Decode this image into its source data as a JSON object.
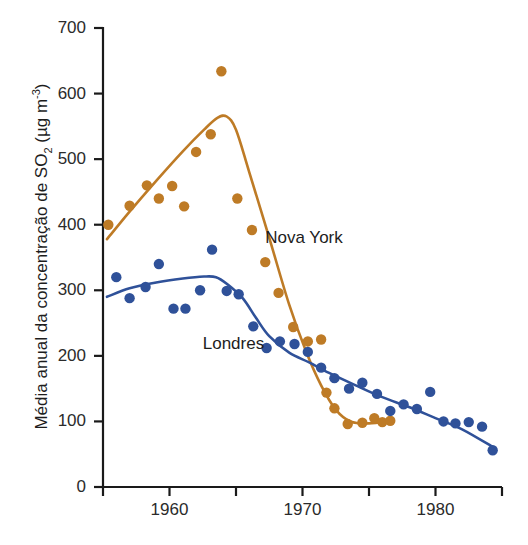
{
  "chart_data": {
    "type": "scatter",
    "title": "",
    "xlabel": "",
    "ylabel": "Média anual da concentração de SO2 (µg m-3)",
    "ylabel_parts": {
      "prefix": "Média anual da concentração de SO",
      "sub": "2",
      "mid": " (µg m",
      "sup": "-3",
      "suffix": ")"
    },
    "xlim": [
      1955,
      1985
    ],
    "ylim": [
      0,
      700
    ],
    "grid": false,
    "legend_position": "inline-annotations",
    "y_ticks": [
      0,
      100,
      200,
      300,
      400,
      500,
      600,
      700
    ],
    "y_tick_labels": [
      "0",
      "100",
      "200",
      "300",
      "400",
      "500",
      "600",
      "700"
    ],
    "x_ticks": [
      1955,
      1960,
      1965,
      1970,
      1975,
      1980,
      1985
    ],
    "x_tick_labels": [
      "",
      "1960",
      "",
      "1970",
      "",
      "1980",
      ""
    ],
    "series": [
      {
        "name": "Nova York",
        "color": "#BE7B26",
        "annotation": "Nova York",
        "annotation_x": 1967.2,
        "annotation_y": 380,
        "points": [
          {
            "x": 1955.4,
            "y": 400
          },
          {
            "x": 1957.0,
            "y": 429
          },
          {
            "x": 1958.3,
            "y": 460
          },
          {
            "x": 1959.2,
            "y": 440
          },
          {
            "x": 1960.2,
            "y": 459
          },
          {
            "x": 1961.1,
            "y": 428
          },
          {
            "x": 1962.0,
            "y": 511
          },
          {
            "x": 1963.1,
            "y": 538
          },
          {
            "x": 1963.9,
            "y": 634
          },
          {
            "x": 1965.1,
            "y": 440
          },
          {
            "x": 1966.2,
            "y": 392
          },
          {
            "x": 1967.2,
            "y": 343
          },
          {
            "x": 1968.2,
            "y": 296
          },
          {
            "x": 1969.3,
            "y": 244
          },
          {
            "x": 1970.4,
            "y": 222
          },
          {
            "x": 1971.4,
            "y": 225
          },
          {
            "x": 1971.8,
            "y": 144
          },
          {
            "x": 1972.4,
            "y": 120
          },
          {
            "x": 1973.4,
            "y": 96
          },
          {
            "x": 1974.5,
            "y": 98
          },
          {
            "x": 1975.4,
            "y": 105
          },
          {
            "x": 1976.0,
            "y": 99
          },
          {
            "x": 1976.6,
            "y": 101
          }
        ],
        "trend": [
          {
            "x": 1955.3,
            "y": 378
          },
          {
            "x": 1957.0,
            "y": 420
          },
          {
            "x": 1959.0,
            "y": 467
          },
          {
            "x": 1961.0,
            "y": 512
          },
          {
            "x": 1962.6,
            "y": 545
          },
          {
            "x": 1963.6,
            "y": 563
          },
          {
            "x": 1964.3,
            "y": 565
          },
          {
            "x": 1965.0,
            "y": 545
          },
          {
            "x": 1966.0,
            "y": 480
          },
          {
            "x": 1967.5,
            "y": 380
          },
          {
            "x": 1969.0,
            "y": 278
          },
          {
            "x": 1970.3,
            "y": 205
          },
          {
            "x": 1971.4,
            "y": 155
          },
          {
            "x": 1972.5,
            "y": 118
          },
          {
            "x": 1973.6,
            "y": 100
          },
          {
            "x": 1975.0,
            "y": 97
          },
          {
            "x": 1976.6,
            "y": 101
          }
        ]
      },
      {
        "name": "Londres",
        "color": "#2F5199",
        "annotation": "Londres",
        "annotation_x": 1962.5,
        "annotation_y": 218,
        "points": [
          {
            "x": 1956.0,
            "y": 320
          },
          {
            "x": 1957.0,
            "y": 288
          },
          {
            "x": 1958.2,
            "y": 305
          },
          {
            "x": 1959.2,
            "y": 340
          },
          {
            "x": 1960.3,
            "y": 272
          },
          {
            "x": 1961.2,
            "y": 272
          },
          {
            "x": 1962.3,
            "y": 300
          },
          {
            "x": 1963.2,
            "y": 362
          },
          {
            "x": 1964.3,
            "y": 299
          },
          {
            "x": 1965.2,
            "y": 294
          },
          {
            "x": 1966.3,
            "y": 245
          },
          {
            "x": 1967.3,
            "y": 212
          },
          {
            "x": 1968.3,
            "y": 222
          },
          {
            "x": 1969.4,
            "y": 218
          },
          {
            "x": 1970.4,
            "y": 206
          },
          {
            "x": 1971.4,
            "y": 182
          },
          {
            "x": 1972.4,
            "y": 166
          },
          {
            "x": 1973.5,
            "y": 150
          },
          {
            "x": 1974.5,
            "y": 159
          },
          {
            "x": 1975.6,
            "y": 142
          },
          {
            "x": 1976.6,
            "y": 116
          },
          {
            "x": 1977.6,
            "y": 126
          },
          {
            "x": 1978.6,
            "y": 119
          },
          {
            "x": 1979.6,
            "y": 145
          },
          {
            "x": 1980.6,
            "y": 100
          },
          {
            "x": 1981.5,
            "y": 97
          },
          {
            "x": 1982.5,
            "y": 99
          },
          {
            "x": 1983.5,
            "y": 92
          },
          {
            "x": 1984.3,
            "y": 56
          }
        ],
        "trend": [
          {
            "x": 1955.3,
            "y": 290
          },
          {
            "x": 1957.0,
            "y": 303
          },
          {
            "x": 1959.0,
            "y": 312
          },
          {
            "x": 1961.0,
            "y": 318
          },
          {
            "x": 1962.6,
            "y": 321
          },
          {
            "x": 1963.5,
            "y": 320
          },
          {
            "x": 1964.3,
            "y": 310
          },
          {
            "x": 1965.5,
            "y": 288
          },
          {
            "x": 1966.5,
            "y": 258
          },
          {
            "x": 1967.5,
            "y": 230
          },
          {
            "x": 1969.0,
            "y": 205
          },
          {
            "x": 1970.5,
            "y": 190
          },
          {
            "x": 1972.0,
            "y": 174
          },
          {
            "x": 1974.0,
            "y": 155
          },
          {
            "x": 1976.0,
            "y": 137
          },
          {
            "x": 1978.0,
            "y": 122
          },
          {
            "x": 1980.0,
            "y": 105
          },
          {
            "x": 1982.0,
            "y": 88
          },
          {
            "x": 1984.4,
            "y": 60
          }
        ]
      }
    ]
  },
  "axis": {
    "axis_color": "#1a1a1a",
    "tick_color": "#1a1a1a"
  }
}
